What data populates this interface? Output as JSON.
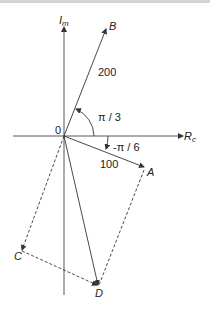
{
  "diagram": {
    "type": "phasor-diagram",
    "axes": {
      "imaginary_label": "I",
      "imaginary_subscript": "m",
      "real_label": "R",
      "real_subscript": "c",
      "origin_label": "0"
    },
    "vectors": [
      {
        "name": "B",
        "magnitude_label": "200",
        "angle_label": "π / 3"
      },
      {
        "name": "A",
        "magnitude_label": "100",
        "angle_label": "-π / 6"
      },
      {
        "name": "C",
        "style": "dashed"
      },
      {
        "name": "D",
        "style": "solid-resultant"
      }
    ],
    "points": {
      "B": "B",
      "A": "A",
      "C": "C",
      "D": "D"
    },
    "colors": {
      "line": "#333333",
      "background": "#ffffff"
    }
  }
}
